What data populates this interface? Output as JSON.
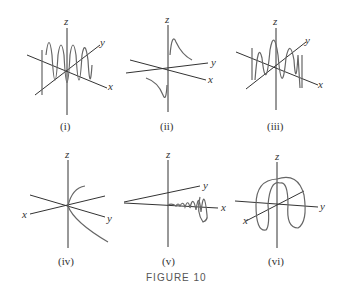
{
  "figure": {
    "title": "FIGURE 10",
    "panels": [
      {
        "id": "i",
        "caption": "(i)",
        "axes": [
          "z",
          "y",
          "x"
        ],
        "description": "dense vertical oscillating curve along x-axis"
      },
      {
        "id": "ii",
        "caption": "(ii)",
        "axes": [
          "z",
          "y",
          "x"
        ],
        "description": "two hyperbola-like branches"
      },
      {
        "id": "iii",
        "caption": "(iii)",
        "axes": [
          "z",
          "y",
          "x"
        ],
        "description": "oscillating curve with varying frequency"
      },
      {
        "id": "iv",
        "caption": "(iv)",
        "axes": [
          "z",
          "x",
          "y"
        ],
        "description": "cusp-like curve through origin"
      },
      {
        "id": "v",
        "caption": "(v)",
        "axes": [
          "z",
          "y",
          "x"
        ],
        "description": "expanding helix along x-axis"
      },
      {
        "id": "vi",
        "caption": "(vi)",
        "axes": [
          "z",
          "y",
          "x"
        ],
        "description": "closed looping curve"
      }
    ]
  }
}
